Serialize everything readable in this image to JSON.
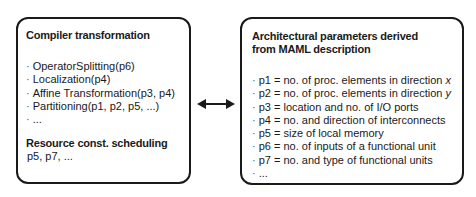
{
  "left_box": {
    "title": "Compiler transformation",
    "items": [
      "OperatorSplitting(p6)",
      "Localization(p4)",
      "Affine Transformation(p3, p4)",
      "Partitioning(p1, p2, p5, ...)",
      "..."
    ],
    "bullet": "·",
    "scheduling_title": "Resource const. scheduling",
    "scheduling_value": "p5, p7, ..."
  },
  "connector": {
    "type": "bidirectional-arrow"
  },
  "right_box": {
    "title_line1": "Architectural parameters derived",
    "title_line2": "from MAML description",
    "items": [
      "p1 = no. of proc. elements in direction x",
      "p2 = no. of proc. elements in direction y",
      "p3 = location and no. of I/O ports",
      "p4 = no. and direction of interconnects",
      "p5 = size of local memory",
      "p6 = no. of inputs of a functional unit",
      "p7 = no. and type of functional units",
      "..."
    ],
    "bullet": "·"
  }
}
